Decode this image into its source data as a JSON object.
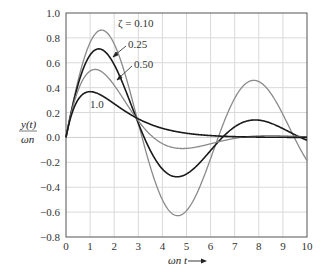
{
  "chart_data": {
    "type": "line",
    "title": "",
    "xlabel": "ωn t",
    "ylabel": "y(t) / ωn",
    "xlim": [
      0,
      10
    ],
    "ylim": [
      -0.8,
      1.0
    ],
    "x_ticks": [
      "0",
      "1",
      "2",
      "3",
      "4",
      "5",
      "6",
      "7",
      "8",
      "9",
      "10"
    ],
    "y_ticks": [
      "1.0",
      "0.8",
      "0.6",
      "0.4",
      "0.2",
      "0.0",
      "−0.2",
      "−0.4",
      "−0.6",
      "−0.8"
    ],
    "grid": true,
    "legend_position": "inline annotations",
    "series": [
      {
        "name": "ζ = 0.10",
        "zeta": 0.1,
        "color": "#8a8a8a",
        "width": 1.3,
        "x": [
          0,
          1.5,
          3.15,
          4.7,
          6.3,
          7.9,
          9.5,
          10
        ],
        "values": [
          0,
          0.86,
          0,
          -0.64,
          0,
          0.43,
          0,
          -0.16
        ]
      },
      {
        "name": "0.25",
        "zeta": 0.25,
        "color": "#1a1a1a",
        "width": 1.6,
        "x": [
          0,
          1.4,
          3.25,
          4.6,
          6.5,
          7.8,
          9.7,
          10
        ],
        "values": [
          0,
          0.69,
          0,
          -0.33,
          0,
          0.1,
          0,
          -0.02
        ]
      },
      {
        "name": "0.50",
        "zeta": 0.5,
        "color": "#8a8a8a",
        "width": 1.3,
        "x": [
          0,
          1.2,
          3.6,
          4.8,
          7.3,
          8.2,
          10
        ],
        "values": [
          0,
          0.54,
          0,
          -0.1,
          0,
          0.02,
          0
        ]
      },
      {
        "name": "1.0",
        "zeta": 1.0,
        "color": "#1a1a1a",
        "width": 1.6,
        "x": [
          0,
          1,
          2,
          3,
          4,
          5,
          6,
          7,
          8,
          9,
          10
        ],
        "values": [
          0,
          0.37,
          0.27,
          0.15,
          0.07,
          0.03,
          0.01,
          0.006,
          0.003,
          0.001,
          0.0005
        ]
      }
    ],
    "annotations": [
      {
        "text": "ζ = 0.10",
        "x": 2.2,
        "y": 0.9
      },
      {
        "text": "0.25",
        "x": 2.5,
        "y": 0.74
      },
      {
        "text": "0.50",
        "x": 2.7,
        "y": 0.58
      },
      {
        "text": "1.0",
        "x": 1.0,
        "y": 0.26
      }
    ]
  },
  "labels": {
    "ylabel_num": "y(t)",
    "ylabel_den": "ωn",
    "xlabel": "ωn t",
    "zeta_label": "ζ = 0.10",
    "label_025": "0.25",
    "label_050": "0.50",
    "label_10": "1.0"
  }
}
